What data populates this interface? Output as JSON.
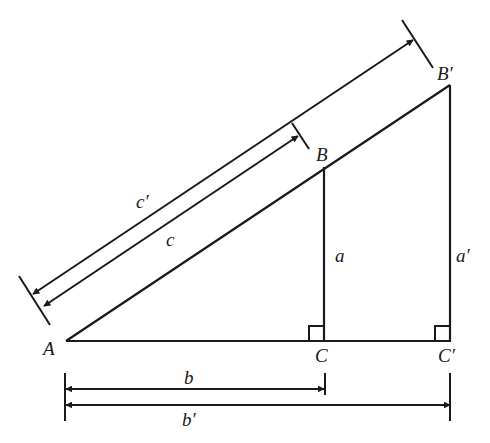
{
  "figure": {
    "type": "similar-right-triangles",
    "vertices": {
      "A": "A",
      "B": "B",
      "C": "C",
      "B_prime": "B′",
      "C_prime": "C′"
    },
    "sides": {
      "a": "a",
      "b": "b",
      "c": "c",
      "a_prime": "a′",
      "b_prime": "b′",
      "c_prime": "c′"
    },
    "colors": {
      "stroke": "#1a1a1a",
      "background": "#ffffff"
    }
  }
}
